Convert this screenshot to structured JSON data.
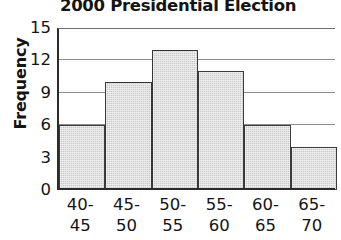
{
  "chart_data": {
    "type": "bar",
    "title": "2000 Presidential Election",
    "xlabel": "",
    "ylabel": "Frequency",
    "categories": [
      "40-\n45",
      "45-\n50",
      "50-\n55",
      "55-\n60",
      "60-\n65",
      "65-\n70"
    ],
    "category_lines": [
      [
        "40-",
        "45"
      ],
      [
        "45-",
        "50"
      ],
      [
        "50-",
        "55"
      ],
      [
        "55-",
        "60"
      ],
      [
        "60-",
        "65"
      ],
      [
        "65-",
        "70"
      ]
    ],
    "values": [
      6,
      10,
      13,
      11,
      6,
      4
    ],
    "ylim": [
      0,
      15
    ],
    "yticks": [
      15,
      12,
      9,
      6,
      3,
      0
    ],
    "ytick_labels": [
      "15",
      "12",
      "9",
      "6",
      "3",
      "0"
    ],
    "grid": true,
    "grid_axis": "y",
    "legend": false,
    "bar_fill": "#c9c9c9",
    "bar_edge": "#3a3a3a",
    "axis_color": "#2b2b2b",
    "grid_color": "#8c8c8c",
    "text_color": "#141414"
  }
}
